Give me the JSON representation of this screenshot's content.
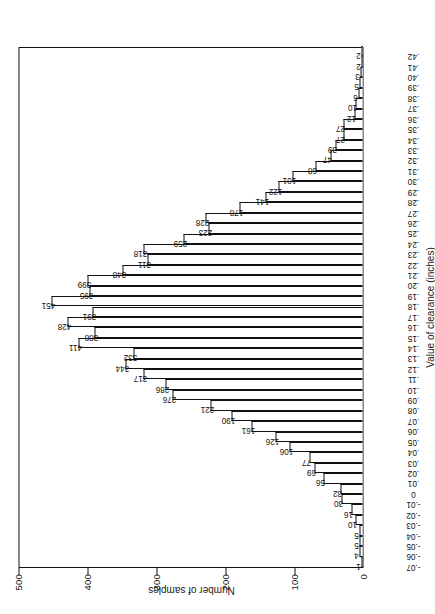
{
  "figure": {
    "axis_value_title": "Number of samples",
    "axis_category_title": "Value of clearance (inches)"
  },
  "chart_data": {
    "type": "bar",
    "title": "",
    "xlabel": "Value of clearance (inches)",
    "ylabel": "Number of samples",
    "ylim": [
      0,
      500
    ],
    "yticks": [
      0,
      100,
      200,
      300,
      400,
      500
    ],
    "ytick_labels": [
      "0",
      "100",
      "200",
      "300",
      "400",
      "500"
    ],
    "grid": false,
    "legend": "none",
    "orientation": "vertical",
    "categories": [
      "-.07",
      "-.06",
      "-.05",
      "-.04",
      "-.03",
      "-.02",
      "-.01",
      "0",
      ".01",
      ".02",
      ".03",
      ".04",
      ".05",
      ".06",
      ".07",
      ".08",
      ".09",
      ".10",
      ".11",
      ".12",
      ".13",
      ".14",
      ".15",
      ".16",
      ".17",
      ".18",
      ".19",
      ".20",
      ".21",
      ".22",
      ".23",
      ".24",
      ".25",
      ".26",
      ".27",
      ".28",
      ".29",
      ".30",
      ".31",
      ".32",
      ".33",
      ".34",
      ".35",
      ".36",
      ".37",
      ".38",
      ".39",
      ".40",
      ".41",
      ".42"
    ],
    "values": [
      1,
      4,
      5,
      5,
      10,
      16,
      30,
      32,
      56,
      69,
      77,
      106,
      126,
      161,
      190,
      221,
      276,
      286,
      317,
      344,
      332,
      411,
      388,
      428,
      391,
      451,
      395,
      399,
      348,
      311,
      318,
      259,
      223,
      228,
      178,
      141,
      122,
      101,
      68,
      47,
      39,
      27,
      27,
      12,
      10,
      6,
      5,
      3,
      2,
      2
    ]
  }
}
